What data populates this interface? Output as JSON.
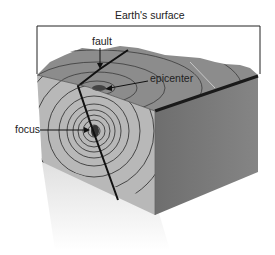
{
  "diagram": {
    "type": "earthquake-block-diagram",
    "labels": {
      "surface": "Earth's surface",
      "fault": "fault",
      "epicenter": "epicenter",
      "focus": "focus"
    },
    "colors": {
      "top_surface": "#8a8a8a",
      "front_face": "#b5b5b5",
      "side_face": "#777777",
      "edge": "#1a1a1a",
      "waves": "#2a2a2a",
      "shadow": "#e4e4e4"
    }
  }
}
